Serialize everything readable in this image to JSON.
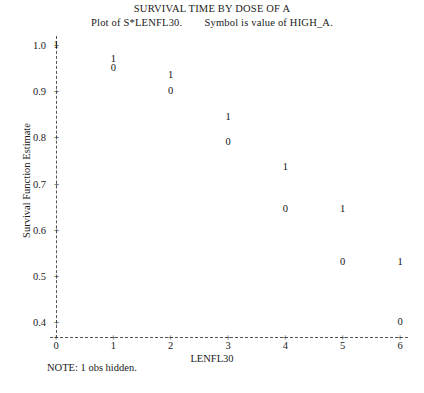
{
  "title": {
    "main": "SURVIVAL TIME BY DOSE OF A",
    "sub_left": "Plot of S*LENFL30.",
    "sub_right": "Symbol is value of HIGH_A."
  },
  "note": "NOTE: 1 obs hidden.",
  "axis": {
    "y_title": "Survival Function Estimate",
    "x_title": "LENFL30",
    "tick_glyph": "+",
    "y_tick_labels": [
      "1.0",
      "0.9",
      "0.8",
      "0.7",
      "0.6",
      "0.5",
      "0.4"
    ],
    "x_tick_labels": [
      "0",
      "1",
      "2",
      "3",
      "4",
      "5",
      "6"
    ]
  },
  "chart_data": {
    "type": "scatter",
    "title": "SURVIVAL TIME BY DOSE OF A",
    "subtitle": "Plot of S*LENFL30.    Symbol is value of HIGH_A.",
    "xlabel": "LENFL30",
    "ylabel": "Survival Function Estimate",
    "xlim": [
      0,
      6
    ],
    "ylim": [
      0.4,
      1.0
    ],
    "xticks": [
      0,
      1,
      2,
      3,
      4,
      5,
      6
    ],
    "yticks": [
      0.4,
      0.5,
      0.6,
      0.7,
      0.8,
      0.9,
      1.0
    ],
    "grid": false,
    "legend": "none",
    "marker_style": "text-symbol",
    "symbol_meaning": "Symbol is value of HIGH_A",
    "annotation": "NOTE: 1 obs hidden.",
    "series": [
      {
        "name": "HIGH_A = 1",
        "symbol": "1",
        "points": [
          {
            "x": 0,
            "y": 1.0
          },
          {
            "x": 1,
            "y": 0.97
          },
          {
            "x": 2,
            "y": 0.935
          },
          {
            "x": 3,
            "y": 0.845
          },
          {
            "x": 4,
            "y": 0.735
          },
          {
            "x": 5,
            "y": 0.645
          },
          {
            "x": 6,
            "y": 0.53
          }
        ]
      },
      {
        "name": "HIGH_A = 0",
        "symbol": "0",
        "points": [
          {
            "x": 1,
            "y": 0.95
          },
          {
            "x": 2,
            "y": 0.9
          },
          {
            "x": 3,
            "y": 0.79
          },
          {
            "x": 4,
            "y": 0.645
          },
          {
            "x": 5,
            "y": 0.53
          },
          {
            "x": 6,
            "y": 0.4
          }
        ]
      }
    ]
  }
}
